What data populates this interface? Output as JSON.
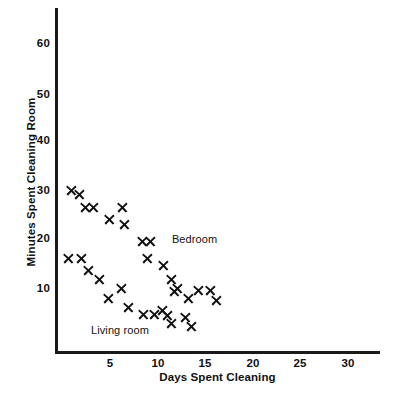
{
  "chart_data": {
    "type": "scatter",
    "title": "",
    "xlabel": "Days Spent Cleaning",
    "ylabel": "Minutes Spent Cleaning Room",
    "xlim": [
      0,
      30
    ],
    "ylim": [
      0,
      65
    ],
    "xticks": [
      5,
      10,
      15,
      20,
      25,
      30
    ],
    "yticks": [
      10,
      20,
      30,
      40,
      50,
      60
    ],
    "grid": false,
    "legend_position": "inline-annotation",
    "marker": "x",
    "marker_color": "#111111",
    "series": [
      {
        "name": "Bedroom",
        "label_x": 11.5,
        "label_y": 20.0,
        "points": [
          [
            1.0,
            30.0
          ],
          [
            1.8,
            29.0
          ],
          [
            2.4,
            26.5
          ],
          [
            3.3,
            26.5
          ],
          [
            4.9,
            24.0
          ],
          [
            6.3,
            26.5
          ],
          [
            6.5,
            23.0
          ],
          [
            8.4,
            19.5
          ],
          [
            9.3,
            19.5
          ],
          [
            8.9,
            16.0
          ],
          [
            10.6,
            14.5
          ],
          [
            11.5,
            11.8
          ],
          [
            12.1,
            10.0
          ],
          [
            11.8,
            9.2
          ],
          [
            13.2,
            7.8
          ],
          [
            14.3,
            9.6
          ],
          [
            15.5,
            9.6
          ],
          [
            16.2,
            7.5
          ]
        ]
      },
      {
        "name": "Living room",
        "label_x": 3.0,
        "label_y": 1.5,
        "points": [
          [
            0.6,
            16.0
          ],
          [
            2.0,
            16.0
          ],
          [
            2.7,
            13.5
          ],
          [
            3.9,
            11.8
          ],
          [
            4.8,
            7.8
          ],
          [
            6.2,
            10.0
          ],
          [
            6.9,
            6.0
          ],
          [
            8.5,
            4.5
          ],
          [
            9.7,
            4.5
          ],
          [
            10.5,
            5.5
          ],
          [
            11.0,
            4.3
          ],
          [
            11.5,
            2.8
          ],
          [
            12.9,
            4.0
          ],
          [
            13.6,
            2.2
          ]
        ]
      }
    ]
  },
  "axes": {
    "x_ticks": [
      "5",
      "10",
      "15",
      "20",
      "25",
      "30"
    ],
    "y_ticks": [
      "60",
      "50",
      "40",
      "30",
      "20",
      "10"
    ],
    "x_title": "Days Spent Cleaning",
    "y_title": "Minutes Spent Cleaning Room"
  },
  "annotations": {
    "bedroom_label": "Bedroom",
    "living_room_label": "Living room"
  }
}
